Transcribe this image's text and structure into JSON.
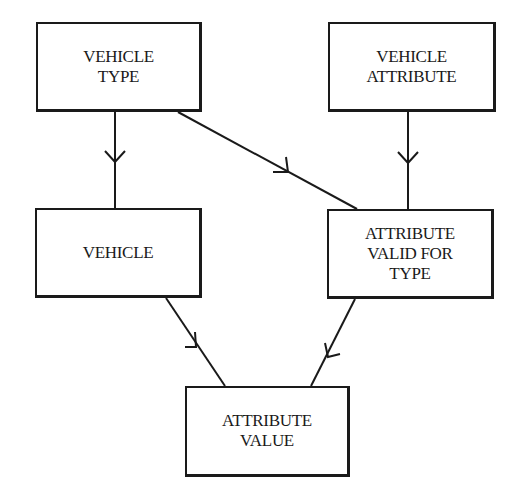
{
  "diagram": {
    "type": "entity-relationship",
    "entities": [
      {
        "id": "vehicle_type",
        "label": "VEHICLE\nTYPE",
        "x": 36,
        "y": 22,
        "w": 166,
        "h": 90
      },
      {
        "id": "vehicle_attribute",
        "label": "VEHICLE\nATTRIBUTE",
        "x": 328,
        "y": 22,
        "w": 168,
        "h": 90
      },
      {
        "id": "vehicle",
        "label": "VEHICLE",
        "x": 35,
        "y": 208,
        "w": 167,
        "h": 90
      },
      {
        "id": "attribute_valid_for_type",
        "label": "ATTRIBUTE\nVALID FOR\nTYPE",
        "x": 327,
        "y": 209,
        "w": 167,
        "h": 90
      },
      {
        "id": "attribute_value",
        "label": "ATTRIBUTE\nVALUE",
        "x": 185,
        "y": 386,
        "w": 165,
        "h": 91
      }
    ],
    "relationships": [
      {
        "from": "vehicle_type",
        "to": "vehicle",
        "cardinality": "one-to-many"
      },
      {
        "from": "vehicle_type",
        "to": "attribute_valid_for_type",
        "cardinality": "one-to-many"
      },
      {
        "from": "vehicle_attribute",
        "to": "attribute_valid_for_type",
        "cardinality": "one-to-many"
      },
      {
        "from": "vehicle",
        "to": "attribute_value",
        "cardinality": "one-to-many"
      },
      {
        "from": "attribute_valid_for_type",
        "to": "attribute_value",
        "cardinality": "one-to-many"
      }
    ]
  },
  "colors": {
    "stroke": "#1a1a1a",
    "background": "#ffffff"
  }
}
